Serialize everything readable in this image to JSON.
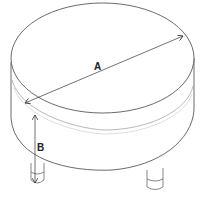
{
  "diagram": {
    "dimensions": [
      {
        "label": "A",
        "meaning": "diameter"
      },
      {
        "label": "B",
        "meaning": "height"
      }
    ]
  },
  "colors": {
    "line": "#333333",
    "background": "#ffffff"
  }
}
